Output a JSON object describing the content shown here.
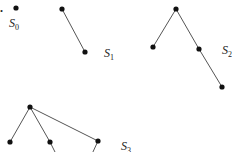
{
  "figure_marker": "a.",
  "trees": [
    {
      "label": "S",
      "subscript": "0",
      "label_pos": [
        9,
        27
      ],
      "nodes": [
        [
          16,
          8
        ]
      ],
      "edges": []
    },
    {
      "label": "S",
      "subscript": "1",
      "label_pos": [
        104,
        57
      ],
      "nodes": [
        [
          62,
          9
        ],
        [
          85,
          52
        ]
      ],
      "edges": [
        [
          0,
          1
        ]
      ]
    },
    {
      "label": "S",
      "subscript": "2",
      "label_pos": [
        222,
        54
      ],
      "nodes": [
        [
          176,
          9
        ],
        [
          153,
          47
        ],
        [
          199,
          49
        ],
        [
          222,
          87
        ]
      ],
      "edges": [
        [
          0,
          1
        ],
        [
          0,
          2
        ],
        [
          2,
          3
        ]
      ]
    },
    {
      "label": "S",
      "subscript": "3",
      "label_pos": [
        121,
        150
      ],
      "nodes": [
        [
          30,
          107
        ],
        [
          10,
          142
        ],
        [
          50,
          142
        ],
        [
          98,
          141
        ]
      ],
      "edges": [
        [
          0,
          1
        ],
        [
          0,
          2
        ],
        [
          0,
          3
        ]
      ],
      "dangling_edges": [
        [
          [
            50,
            142
          ],
          [
            56,
            154
          ]
        ],
        [
          [
            98,
            141
          ],
          [
            92,
            154
          ]
        ]
      ]
    }
  ],
  "colors": {
    "node": "#111111",
    "edge": "#555555",
    "text": "#222222"
  }
}
